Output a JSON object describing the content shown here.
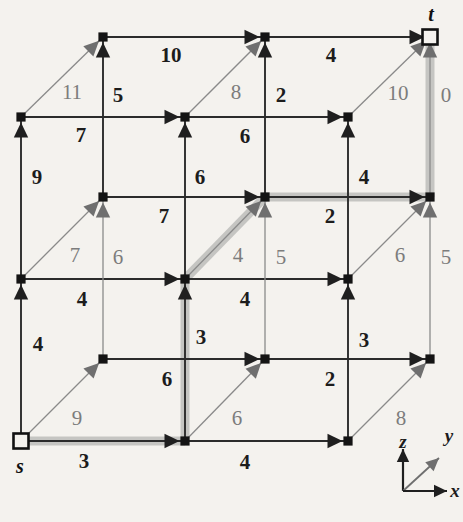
{
  "figure": {
    "kind": "shortest-path-lattice-diagram",
    "node_labels": [
      {
        "name": "source-node-label",
        "text": "s",
        "x": 20,
        "y": 466
      },
      {
        "name": "sink-node-label",
        "text": "t",
        "x": 431,
        "y": 14
      }
    ],
    "axis_legend": {
      "name": "axis-legend",
      "origin_x": 403,
      "origin_y": 491,
      "labels": [
        {
          "name": "axis-label-z",
          "text": "z",
          "x": 403,
          "y": 442
        },
        {
          "name": "axis-label-y",
          "text": "y",
          "x": 449,
          "y": 436
        },
        {
          "name": "axis-label-x",
          "text": "x",
          "x": 455,
          "y": 491
        }
      ]
    },
    "nodes": [
      {
        "id": "n-back-top-L",
        "x": 103,
        "y": 37,
        "style": "filled"
      },
      {
        "id": "n-back-top-M",
        "x": 265,
        "y": 37,
        "style": "filled"
      },
      {
        "id": "n-back-top-R",
        "x": 430,
        "y": 37,
        "style": "hollow"
      },
      {
        "id": "n-front-top-L",
        "x": 21,
        "y": 117,
        "style": "filled"
      },
      {
        "id": "n-front-top-M",
        "x": 185,
        "y": 117,
        "style": "filled"
      },
      {
        "id": "n-front-top-R",
        "x": 348,
        "y": 117,
        "style": "filled"
      },
      {
        "id": "n-back-mid-L",
        "x": 103,
        "y": 197,
        "style": "filled"
      },
      {
        "id": "n-back-mid-M",
        "x": 265,
        "y": 197,
        "style": "filled"
      },
      {
        "id": "n-back-mid-R",
        "x": 430,
        "y": 197,
        "style": "filled"
      },
      {
        "id": "n-front-mid-L",
        "x": 21,
        "y": 279,
        "style": "filled"
      },
      {
        "id": "n-front-mid-M",
        "x": 185,
        "y": 279,
        "style": "filled"
      },
      {
        "id": "n-front-mid-R",
        "x": 348,
        "y": 279,
        "style": "filled"
      },
      {
        "id": "n-back-bot-L",
        "x": 103,
        "y": 359,
        "style": "filled"
      },
      {
        "id": "n-back-bot-M",
        "x": 265,
        "y": 359,
        "style": "filled"
      },
      {
        "id": "n-back-bot-R",
        "x": 430,
        "y": 359,
        "style": "filled"
      },
      {
        "id": "n-front-bot-L",
        "x": 21,
        "y": 441,
        "style": "hollow"
      },
      {
        "id": "n-front-bot-M",
        "x": 185,
        "y": 441,
        "style": "filled"
      },
      {
        "id": "n-front-bot-R",
        "x": 348,
        "y": 441,
        "style": "filled"
      }
    ],
    "edges": [
      {
        "id": "e-bt-L-M",
        "from": [
          103,
          37
        ],
        "to": [
          265,
          37
        ],
        "dir": "x",
        "weight": "10",
        "wx": 171,
        "wy": 55,
        "tone": "dark",
        "hl": false
      },
      {
        "id": "e-bt-M-R",
        "from": [
          265,
          37
        ],
        "to": [
          430,
          37
        ],
        "dir": "x",
        "weight": "4",
        "wx": 331,
        "wy": 55,
        "tone": "dark",
        "hl": false
      },
      {
        "id": "e-bm-L-M",
        "from": [
          103,
          197
        ],
        "to": [
          265,
          197
        ],
        "dir": "x",
        "weight": "7",
        "wx": 164,
        "wy": 216,
        "tone": "dark",
        "hl": false
      },
      {
        "id": "e-bm-M-R",
        "from": [
          265,
          197
        ],
        "to": [
          430,
          197
        ],
        "dir": "x",
        "weight": "2",
        "wx": 330,
        "wy": 216,
        "tone": "dark",
        "hl": true
      },
      {
        "id": "e-bb-L-M",
        "from": [
          103,
          359
        ],
        "to": [
          265,
          359
        ],
        "dir": "x",
        "weight": "6",
        "wx": 167,
        "wy": 379,
        "tone": "dark",
        "hl": false
      },
      {
        "id": "e-bb-M-R",
        "from": [
          265,
          359
        ],
        "to": [
          430,
          359
        ],
        "dir": "x",
        "weight": "2",
        "wx": 330,
        "wy": 379,
        "tone": "dark",
        "hl": false
      },
      {
        "id": "e-ft-L-M",
        "from": [
          21,
          117
        ],
        "to": [
          185,
          117
        ],
        "dir": "x",
        "weight": "7",
        "wx": 81,
        "wy": 135,
        "tone": "dark",
        "hl": false
      },
      {
        "id": "e-ft-M-R",
        "from": [
          185,
          117
        ],
        "to": [
          348,
          117
        ],
        "dir": "x",
        "weight": "6",
        "wx": 245,
        "wy": 136,
        "tone": "dark",
        "hl": false
      },
      {
        "id": "e-fm-L-M",
        "from": [
          21,
          279
        ],
        "to": [
          185,
          279
        ],
        "dir": "x",
        "weight": "4",
        "wx": 82,
        "wy": 299,
        "tone": "dark",
        "hl": false
      },
      {
        "id": "e-fm-M-R",
        "from": [
          185,
          279
        ],
        "to": [
          348,
          279
        ],
        "dir": "x",
        "weight": "4",
        "wx": 245,
        "wy": 299,
        "tone": "dark",
        "hl": false
      },
      {
        "id": "e-fb-L-M",
        "from": [
          21,
          441
        ],
        "to": [
          185,
          441
        ],
        "dir": "x",
        "weight": "3",
        "wx": 84,
        "wy": 461,
        "tone": "dark",
        "hl": true
      },
      {
        "id": "e-fb-M-R",
        "from": [
          185,
          441
        ],
        "to": [
          348,
          441
        ],
        "dir": "x",
        "weight": "4",
        "wx": 245,
        "wy": 462,
        "tone": "dark",
        "hl": false
      },
      {
        "id": "e-vz-fb-fm-L",
        "from": [
          21,
          441
        ],
        "to": [
          21,
          279
        ],
        "dir": "z",
        "weight": "4",
        "wx": 38,
        "wy": 344,
        "tone": "dark",
        "hl": false
      },
      {
        "id": "e-vz-fm-ft-L",
        "from": [
          21,
          279
        ],
        "to": [
          21,
          117
        ],
        "dir": "z",
        "weight": "9",
        "wx": 37,
        "wy": 177,
        "tone": "dark",
        "hl": false
      },
      {
        "id": "e-vz-fb-fm-M",
        "from": [
          185,
          441
        ],
        "to": [
          185,
          279
        ],
        "dir": "z",
        "weight": "3",
        "wx": 201,
        "wy": 337,
        "tone": "dark",
        "hl": true
      },
      {
        "id": "e-vz-fm-ft-M",
        "from": [
          185,
          279
        ],
        "to": [
          185,
          117
        ],
        "dir": "z",
        "weight": "6",
        "wx": 200,
        "wy": 177,
        "tone": "dark",
        "hl": false
      },
      {
        "id": "e-vz-fb-fm-R",
        "from": [
          348,
          441
        ],
        "to": [
          348,
          279
        ],
        "dir": "z",
        "weight": "3",
        "wx": 364,
        "wy": 340,
        "tone": "dark",
        "hl": false
      },
      {
        "id": "e-vz-fm-ft-R",
        "from": [
          348,
          279
        ],
        "to": [
          348,
          117
        ],
        "dir": "z",
        "weight": "4",
        "wx": 364,
        "wy": 177,
        "tone": "dark",
        "hl": false
      },
      {
        "id": "e-vz-bb-bm-L",
        "from": [
          103,
          359
        ],
        "to": [
          103,
          197
        ],
        "dir": "z",
        "weight": "6",
        "wx": 118,
        "wy": 257,
        "tone": "gray",
        "hl": false
      },
      {
        "id": "e-vz-bm-bt-L",
        "from": [
          103,
          197
        ],
        "to": [
          103,
          37
        ],
        "dir": "z",
        "weight": "5",
        "wx": 118,
        "wy": 95,
        "tone": "dark",
        "hl": false
      },
      {
        "id": "e-vz-bb-bm-M",
        "from": [
          265,
          359
        ],
        "to": [
          265,
          197
        ],
        "dir": "z",
        "weight": "5",
        "wx": 281,
        "wy": 257,
        "tone": "gray",
        "hl": false
      },
      {
        "id": "e-vz-bm-bt-M",
        "from": [
          265,
          197
        ],
        "to": [
          265,
          37
        ],
        "dir": "z",
        "weight": "2",
        "wx": 281,
        "wy": 95,
        "tone": "dark",
        "hl": false
      },
      {
        "id": "e-vz-bb-bm-R",
        "from": [
          430,
          359
        ],
        "to": [
          430,
          197
        ],
        "dir": "z",
        "weight": "5",
        "wx": 446,
        "wy": 257,
        "tone": "gray",
        "hl": false
      },
      {
        "id": "e-vz-bm-bt-R",
        "from": [
          430,
          197
        ],
        "to": [
          430,
          37
        ],
        "dir": "z",
        "weight": "0",
        "wx": 446,
        "wy": 95,
        "tone": "gray",
        "hl": true
      },
      {
        "id": "e-dy-fb-bb-L",
        "from": [
          21,
          441
        ],
        "to": [
          103,
          359
        ],
        "dir": "y",
        "weight": "9",
        "wx": 77,
        "wy": 418,
        "tone": "gray",
        "hl": false
      },
      {
        "id": "e-dy-fm-bm-L",
        "from": [
          21,
          279
        ],
        "to": [
          103,
          197
        ],
        "dir": "y",
        "weight": "7",
        "wx": 75,
        "wy": 255,
        "tone": "gray",
        "hl": false
      },
      {
        "id": "e-dy-ft-bt-L",
        "from": [
          21,
          117
        ],
        "to": [
          103,
          37
        ],
        "dir": "y",
        "weight": "11",
        "wx": 72,
        "wy": 92,
        "tone": "gray",
        "hl": false
      },
      {
        "id": "e-dy-fb-bb-M",
        "from": [
          185,
          441
        ],
        "to": [
          265,
          359
        ],
        "dir": "y",
        "weight": "6",
        "wx": 237,
        "wy": 418,
        "tone": "gray",
        "hl": false
      },
      {
        "id": "e-dy-fm-bm-M",
        "from": [
          185,
          279
        ],
        "to": [
          265,
          197
        ],
        "dir": "y",
        "weight": "4",
        "wx": 238,
        "wy": 255,
        "tone": "gray",
        "hl": true
      },
      {
        "id": "e-dy-ft-bt-M",
        "from": [
          185,
          117
        ],
        "to": [
          265,
          37
        ],
        "dir": "y",
        "weight": "8",
        "wx": 236,
        "wy": 92,
        "tone": "gray",
        "hl": false
      },
      {
        "id": "e-dy-fb-bb-R",
        "from": [
          348,
          441
        ],
        "to": [
          430,
          359
        ],
        "dir": "y",
        "weight": "8",
        "wx": 401,
        "wy": 418,
        "tone": "gray",
        "hl": false
      },
      {
        "id": "e-dy-fm-bm-R",
        "from": [
          348,
          279
        ],
        "to": [
          430,
          197
        ],
        "dir": "y",
        "weight": "6",
        "wx": 400,
        "wy": 255,
        "tone": "gray",
        "hl": false
      },
      {
        "id": "e-dy-ft-bt-R",
        "from": [
          348,
          117
        ],
        "to": [
          430,
          37
        ],
        "dir": "y",
        "weight": "10",
        "wx": 398,
        "wy": 93,
        "tone": "gray",
        "hl": false
      }
    ],
    "highlight_path": {
      "name": "shortest-path-highlight",
      "color": "#c3c3c0",
      "segments": [
        [
          [
            21,
            441
          ],
          [
            185,
            441
          ]
        ],
        [
          [
            185,
            441
          ],
          [
            185,
            279
          ]
        ],
        [
          [
            185,
            279
          ],
          [
            265,
            197
          ]
        ],
        [
          [
            265,
            197
          ],
          [
            430,
            197
          ]
        ],
        [
          [
            430,
            197
          ],
          [
            430,
            37
          ]
        ]
      ]
    },
    "colors": {
      "background": "#f4f2ee",
      "edge_dark": "#2b2b2b",
      "edge_gray": "#8a8a8a",
      "arrow_dark": "#1f1f1f",
      "arrow_gray": "#6f6f6f",
      "highlight": "#c6c6c2",
      "node_fill": "#141414"
    }
  }
}
